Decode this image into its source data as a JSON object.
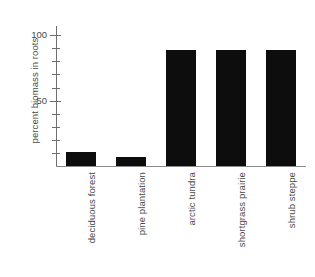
{
  "chart_data": {
    "type": "bar",
    "title": "",
    "xlabel": "",
    "ylabel": "percent biomass in roots",
    "categories": [
      "deciduous forest",
      "pine plantation",
      "arctic tundra",
      "shortgrass prairie",
      "shrub steppe"
    ],
    "values": [
      11,
      7,
      89,
      89,
      89
    ],
    "ylim": [
      0,
      107
    ],
    "ytick_labels": [
      "100",
      "50"
    ],
    "ytick_values": [
      100,
      50
    ],
    "yminor_ticks": [
      10,
      20,
      30,
      40,
      60,
      70,
      80,
      90
    ],
    "grid": false,
    "legend": null,
    "bar_color": "#0d0d0d",
    "axis_color": "#6f6f6f",
    "text_color": "#4a4a4a",
    "background": "#ffffff"
  },
  "axis": {
    "y_title": "percent biomass in roots",
    "tick_100": "100",
    "tick_50": "50"
  }
}
